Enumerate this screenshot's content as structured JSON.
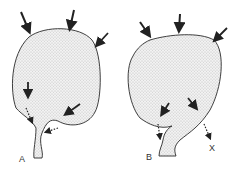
{
  "figure": {
    "panels": [
      {
        "id": "A",
        "label": "A"
      },
      {
        "id": "B",
        "label": "B",
        "extra_label": "X"
      }
    ],
    "colors": {
      "stroke": "#2a2a2a",
      "fill": "#e4e4e4",
      "stipple": "#8a8a8a"
    }
  }
}
